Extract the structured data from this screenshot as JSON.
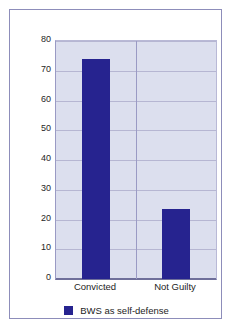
{
  "figure": {
    "background_color": "#ffffff",
    "frame_color": "#8d8dba"
  },
  "chart_data": {
    "type": "bar",
    "title": "",
    "subtitle": "",
    "xlabel": "",
    "ylabel": "",
    "categories": [
      "Convicted",
      "Not Guilty"
    ],
    "values": [
      74,
      23.5
    ],
    "series": [
      {
        "name": "BWS as self-defense",
        "color": "#26238f",
        "values": [
          74,
          23.5
        ]
      }
    ],
    "ylim": [
      0,
      80
    ],
    "ytick_values": [
      0,
      10,
      20,
      30,
      40,
      50,
      60,
      70,
      80
    ],
    "ytick_labels": [
      "0",
      "10",
      "20",
      "30",
      "40",
      "50",
      "60",
      "70",
      "80"
    ],
    "grid": "horizontal",
    "plot_background_color": "#dcdfee",
    "gridline_color": "#b6b6d2",
    "axis_color": "#6f6f9a",
    "legend_position": "bottom-center",
    "legend_entries": [
      {
        "label": "BWS as self-defense",
        "color": "#26238f"
      }
    ],
    "annotations": []
  }
}
